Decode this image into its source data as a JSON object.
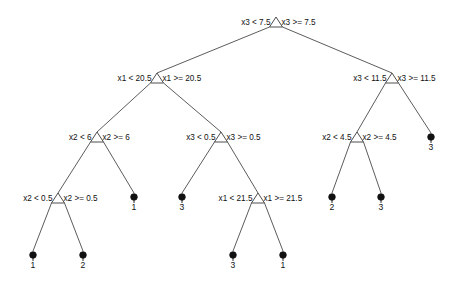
{
  "figure": {
    "width": 457,
    "height": 282,
    "background": "#ffffff",
    "line_color": "#4a4a4a",
    "node_fill": "#ffffff",
    "leaf_fill": "#111111",
    "text_color": "#111111"
  },
  "chart_data": {
    "type": "diagram",
    "diagram_type": "decision-tree",
    "title": "",
    "variables": [
      "x1",
      "x2",
      "x3"
    ],
    "class_labels": [
      "1",
      "2",
      "3"
    ],
    "split_nodes": [
      {
        "id": "n0",
        "depth": 0,
        "x": 276,
        "y": 22,
        "feature": "x3",
        "threshold": 7.5,
        "left_label": "x3 < 7.5",
        "right_label": "x3 >= 7.5",
        "left_child": "n1",
        "right_child": "n2"
      },
      {
        "id": "n1",
        "depth": 1,
        "x": 157,
        "y": 78,
        "feature": "x1",
        "threshold": 20.5,
        "left_label": "x1 < 20.5",
        "right_label": "x1 >= 20.5",
        "left_child": "n3",
        "right_child": "n4"
      },
      {
        "id": "n2",
        "depth": 1,
        "x": 392,
        "y": 78,
        "feature": "x3",
        "threshold": 11.5,
        "left_label": "x3 < 11.5",
        "right_label": "x3 >= 11.5",
        "left_child": "n5",
        "right_child": "l8"
      },
      {
        "id": "n3",
        "depth": 2,
        "x": 97,
        "y": 137,
        "feature": "x2",
        "threshold": 6,
        "left_label": "x2 < 6",
        "right_label": "x2 >= 6",
        "left_child": "n6",
        "right_child": "l3"
      },
      {
        "id": "n4",
        "depth": 2,
        "x": 221,
        "y": 137,
        "feature": "x3",
        "threshold": 0.5,
        "left_label": "x3 < 0.5",
        "right_label": "x3 >= 0.5",
        "left_child": "l4",
        "right_child": "n7"
      },
      {
        "id": "n5",
        "depth": 2,
        "x": 357,
        "y": 137,
        "feature": "x2",
        "threshold": 4.5,
        "left_label": "x2 < 4.5",
        "right_label": "x2 >= 4.5",
        "left_child": "l6",
        "right_child": "l7"
      },
      {
        "id": "n6",
        "depth": 3,
        "x": 58,
        "y": 198,
        "feature": "x2",
        "threshold": 0.5,
        "left_label": "x2 < 0.5",
        "right_label": "x2 >= 0.5",
        "left_child": "l0",
        "right_child": "l1"
      },
      {
        "id": "n7",
        "depth": 3,
        "x": 258,
        "y": 198,
        "feature": "x1",
        "threshold": 21.5,
        "left_label": "x1 < 21.5",
        "right_label": "x1 >= 21.5",
        "left_child": "l2",
        "right_child": "l5"
      }
    ],
    "leaf_nodes": [
      {
        "id": "l0",
        "x": 33,
        "y": 255,
        "label": "1"
      },
      {
        "id": "l1",
        "x": 83,
        "y": 255,
        "label": "2"
      },
      {
        "id": "l3",
        "x": 134,
        "y": 197,
        "label": "1"
      },
      {
        "id": "l4",
        "x": 182,
        "y": 197,
        "label": "3"
      },
      {
        "id": "l2",
        "x": 233,
        "y": 255,
        "label": "3"
      },
      {
        "id": "l5",
        "x": 283,
        "y": 255,
        "label": "1"
      },
      {
        "id": "l6",
        "x": 332,
        "y": 197,
        "label": "2"
      },
      {
        "id": "l7",
        "x": 381,
        "y": 197,
        "label": "3"
      },
      {
        "id": "l8",
        "x": 431,
        "y": 137,
        "label": "3"
      }
    ],
    "edges": [
      {
        "from": "n0",
        "to": "n1",
        "side": "left"
      },
      {
        "from": "n0",
        "to": "n2",
        "side": "right"
      },
      {
        "from": "n1",
        "to": "n3",
        "side": "left"
      },
      {
        "from": "n1",
        "to": "n4",
        "side": "right"
      },
      {
        "from": "n2",
        "to": "n5",
        "side": "left"
      },
      {
        "from": "n2",
        "to": "l8",
        "side": "right"
      },
      {
        "from": "n3",
        "to": "n6",
        "side": "left"
      },
      {
        "from": "n3",
        "to": "l3",
        "side": "right"
      },
      {
        "from": "n4",
        "to": "l4",
        "side": "left"
      },
      {
        "from": "n4",
        "to": "n7",
        "side": "right"
      },
      {
        "from": "n5",
        "to": "l6",
        "side": "left"
      },
      {
        "from": "n5",
        "to": "l7",
        "side": "right"
      },
      {
        "from": "n6",
        "to": "l0",
        "side": "left"
      },
      {
        "from": "n6",
        "to": "l1",
        "side": "right"
      },
      {
        "from": "n7",
        "to": "l2",
        "side": "left"
      },
      {
        "from": "n7",
        "to": "l5",
        "side": "right"
      }
    ]
  }
}
